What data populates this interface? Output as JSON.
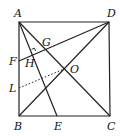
{
  "diagram": {
    "type": "geometry",
    "points": {
      "A": {
        "label": "A",
        "x": 19,
        "y": 22
      },
      "D": {
        "label": "D",
        "x": 109,
        "y": 22
      },
      "B": {
        "label": "B",
        "x": 19,
        "y": 116
      },
      "C": {
        "label": "C",
        "x": 110,
        "y": 116
      },
      "E": {
        "label": "E",
        "x": 57,
        "y": 116
      },
      "F": {
        "label": "F",
        "x": 19,
        "y": 61
      },
      "L": {
        "label": "L",
        "x": 19,
        "y": 88
      },
      "O": {
        "label": "O",
        "x": 64,
        "y": 69
      },
      "G": {
        "label": "G",
        "x": 45,
        "y": 49
      },
      "H": {
        "label": "H",
        "x": 33,
        "y": 53
      }
    },
    "labels": {
      "A": "A",
      "D": "D",
      "B": "B",
      "C": "C",
      "E": "E",
      "F": "F",
      "L": "L",
      "O": "O",
      "G": "G",
      "H": "H"
    },
    "segments": [
      "AB",
      "BC",
      "CD",
      "DA",
      "AC",
      "BD",
      "AE",
      "FD"
    ],
    "dotted_segments": [
      "LO"
    ],
    "right_angle_marks": [
      "H"
    ]
  }
}
